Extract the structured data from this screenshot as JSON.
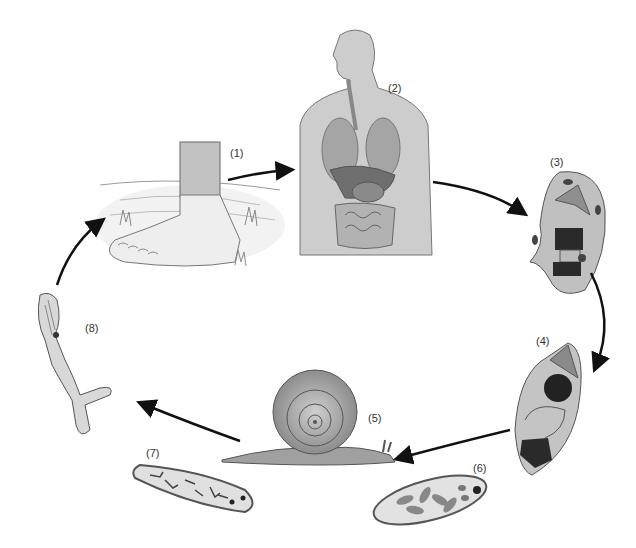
{
  "diagram": {
    "type": "life-cycle",
    "stages": [
      {
        "id": 1,
        "label": "(1)",
        "depicts": "foot-in-water"
      },
      {
        "id": 2,
        "label": "(2)",
        "depicts": "human-body-organs"
      },
      {
        "id": 3,
        "label": "(3)",
        "depicts": "larva-stage-3"
      },
      {
        "id": 4,
        "label": "(4)",
        "depicts": "larva-stage-4"
      },
      {
        "id": 5,
        "label": "(5)",
        "depicts": "snail"
      },
      {
        "id": 6,
        "label": "(6)",
        "depicts": "sporocyst-with-cells"
      },
      {
        "id": 7,
        "label": "(7)",
        "depicts": "sporocyst-with-cercariae"
      },
      {
        "id": 8,
        "label": "(8)",
        "depicts": "cercaria-forked-tail"
      }
    ],
    "arrows": [
      {
        "from": 1,
        "to": 2
      },
      {
        "from": 2,
        "to": 3
      },
      {
        "from": 3,
        "to": 4
      },
      {
        "from": 4,
        "to": 5
      },
      {
        "from": 5,
        "to": 8
      },
      {
        "from": 8,
        "to": 1
      }
    ],
    "colors": {
      "background": "#ffffff",
      "body_fill": "#c8c8c8",
      "organ_fill": "#9a9a9a",
      "dark": "#2a2a2a",
      "outline": "#555555",
      "arrow": "#111111"
    }
  }
}
